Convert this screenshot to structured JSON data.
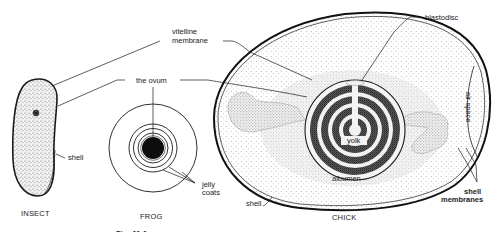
{
  "figure": {
    "caption_partial": "Fig. 11.1 ..."
  },
  "labels": {
    "vitelline_membrane_1": "vitelline",
    "vitelline_membrane_2": "membrane",
    "the_ovum": "the ovum",
    "insect_shell": "shell",
    "jelly_coats_1": "jelly",
    "jelly_coats_2": "coats",
    "blastodisc": "blastodisc",
    "yolk": "yolk",
    "albumen": "albumen",
    "chick_shell": "shell",
    "shell_membranes_1": "shell",
    "shell_membranes_2": "membranes",
    "air_space": "air space"
  },
  "specimens": [
    {
      "name": "INSECT"
    },
    {
      "name": "FROG"
    },
    {
      "name": "CHICK"
    }
  ],
  "colors": {
    "ink": "#1a1a1a",
    "background": "#ffffff",
    "stipple_light": "#e6e6e6",
    "stipple_mid": "#bdbdbd",
    "yolk_dark": "#3a3a3a"
  }
}
